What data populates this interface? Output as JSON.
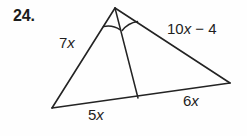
{
  "problem": {
    "number": "24."
  },
  "figure": {
    "name": "triangle-with-angle-bisector",
    "stroke_color": "#232323",
    "background_color": "#fefefe",
    "vertices": {
      "apex": [
        115,
        8
      ],
      "bottom_left": [
        52,
        108
      ],
      "right": [
        230,
        83
      ],
      "cevian_foot": [
        138,
        98
      ]
    },
    "angle_marks": [
      {
        "name": "angle-arc-left",
        "between": [
          "apex-to-bottom-left",
          "apex-to-cevian-foot"
        ]
      },
      {
        "name": "angle-arc-right",
        "between": [
          "apex-to-cevian-foot",
          "apex-to-right"
        ]
      }
    ],
    "labels": {
      "left_side": {
        "prefix": "7",
        "variable": "x",
        "suffix": ""
      },
      "right_side": {
        "prefix": "10",
        "variable": "x",
        "suffix": " − 4"
      },
      "base_left": {
        "prefix": "5",
        "variable": "x",
        "suffix": ""
      },
      "base_right": {
        "prefix": "6",
        "variable": "x",
        "suffix": ""
      }
    }
  }
}
